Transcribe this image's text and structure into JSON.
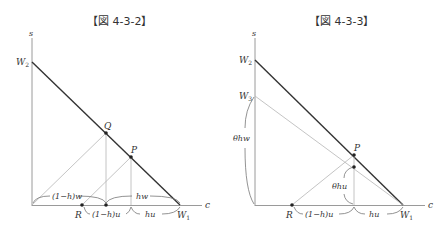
{
  "figures": [
    {
      "title": "【図 4-3-2】",
      "labels": {
        "s_axis": "s",
        "c_axis": "c",
        "w2": "W",
        "w2_sub": "2",
        "w1": "W",
        "w1_sub": "1",
        "q": "Q",
        "p": "P",
        "r": "R",
        "brace_1_h_w": "(1−h)w",
        "brace_hw": "hw",
        "brace_1_h_u": "(1−h)u",
        "brace_hu": "hu"
      }
    },
    {
      "title": "【図 4-3-3】",
      "labels": {
        "s_axis": "s",
        "c_axis": "c",
        "w2": "W",
        "w2_sub": "2",
        "w3": "W",
        "w3_sub": "3",
        "w1": "W",
        "w1_sub": "1",
        "p": "P",
        "r": "R",
        "brace_theta_hw": "θhw",
        "brace_theta_hu": "θhu",
        "brace_1_h_u": "(1−h)u",
        "brace_hu": "hu"
      }
    }
  ],
  "colors": {
    "axis": "#9a9a9a",
    "budget_line": "#333333",
    "guide_line": "#b5b5b5",
    "text": "#333333"
  }
}
